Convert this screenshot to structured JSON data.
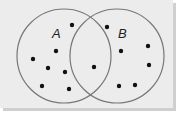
{
  "diagram": {
    "type": "venn",
    "background": "#ececec",
    "stroke": "#777777",
    "dot_color": "#111111",
    "sets": [
      {
        "name": "A",
        "label": "A",
        "cx": 64,
        "cy": 56,
        "r": 47,
        "label_x": 52,
        "label_y": 38
      },
      {
        "name": "B",
        "label": "B",
        "cx": 117,
        "cy": 56,
        "r": 47,
        "label_x": 118,
        "label_y": 38
      }
    ],
    "points": {
      "A_only": [
        [
          72,
          25
        ],
        [
          56,
          51
        ],
        [
          33,
          59
        ],
        [
          48,
          68
        ],
        [
          65,
          72
        ],
        [
          42,
          86
        ],
        [
          69,
          89
        ]
      ],
      "A_and_B": [
        [
          94,
          67
        ]
      ],
      "B_only": [
        [
          107,
          27
        ],
        [
          121,
          51
        ],
        [
          148,
          46
        ],
        [
          149,
          65
        ],
        [
          119,
          86
        ],
        [
          135,
          85
        ]
      ]
    },
    "counts": {
      "A_only": 7,
      "A_and_B": 1,
      "B_only": 6
    }
  }
}
